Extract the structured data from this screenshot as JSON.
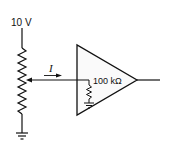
{
  "diagram": {
    "type": "circuit",
    "supply_label": "10 V",
    "current_label": "I",
    "input_resistance_label": "100 kΩ",
    "components": [
      {
        "name": "potentiometer",
        "connected_to": [
          "10 V supply",
          "ground"
        ]
      },
      {
        "name": "amplifier",
        "shape": "triangle"
      },
      {
        "name": "input-resistor",
        "value": "100 kΩ",
        "inside": "amplifier"
      },
      {
        "name": "ground-symbol",
        "count": 2
      }
    ],
    "colors": {
      "line": "#111111",
      "background": "#ffffff"
    }
  }
}
